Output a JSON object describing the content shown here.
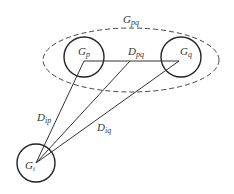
{
  "diagram": {
    "group_label": {
      "main": "G",
      "sub": "pq"
    },
    "nodes": [
      {
        "id": "Gp",
        "main": "G",
        "sub": "p"
      },
      {
        "id": "Gq",
        "main": "G",
        "sub": "q"
      },
      {
        "id": "Gi",
        "main": "G",
        "sub": "i"
      }
    ],
    "edges": [
      {
        "id": "Dpq",
        "main": "D",
        "sub": "pq"
      },
      {
        "id": "Dip",
        "main": "D",
        "sub": "ip"
      },
      {
        "id": "Diq",
        "main": "D",
        "sub": "iq"
      }
    ],
    "colors": {
      "stroke": "#222222",
      "text": "#333333"
    }
  }
}
